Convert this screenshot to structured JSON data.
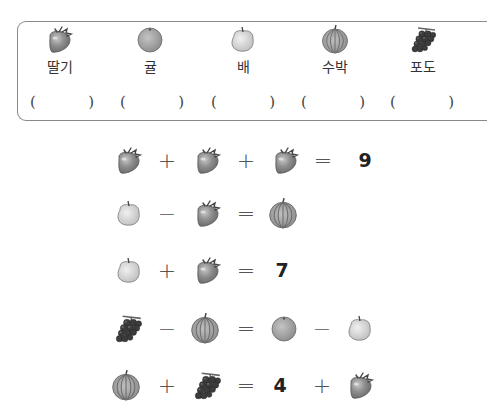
{
  "legend": {
    "items": [
      {
        "key": "strawberry",
        "label": "딸기",
        "answer": ""
      },
      {
        "key": "tangerine",
        "label": "귤",
        "answer": ""
      },
      {
        "key": "pear",
        "label": "배",
        "answer": ""
      },
      {
        "key": "watermelon",
        "label": "수박",
        "answer": ""
      },
      {
        "key": "grapes",
        "label": "포도",
        "answer": ""
      }
    ],
    "paren_open": "(",
    "paren_close": ")"
  },
  "equations": [
    {
      "tokens": [
        {
          "type": "fruit",
          "value": "strawberry"
        },
        {
          "type": "op",
          "value": "+"
        },
        {
          "type": "fruit",
          "value": "strawberry"
        },
        {
          "type": "op",
          "value": "+"
        },
        {
          "type": "fruit",
          "value": "strawberry"
        },
        {
          "type": "op",
          "value": "="
        },
        {
          "type": "num",
          "value": "9"
        }
      ]
    },
    {
      "tokens": [
        {
          "type": "fruit",
          "value": "pear"
        },
        {
          "type": "op",
          "value": "−"
        },
        {
          "type": "fruit",
          "value": "strawberry"
        },
        {
          "type": "op",
          "value": "="
        },
        {
          "type": "fruit",
          "value": "watermelon"
        }
      ]
    },
    {
      "tokens": [
        {
          "type": "fruit",
          "value": "pear"
        },
        {
          "type": "op",
          "value": "+"
        },
        {
          "type": "fruit",
          "value": "strawberry"
        },
        {
          "type": "op",
          "value": "="
        },
        {
          "type": "num",
          "value": "7"
        }
      ]
    },
    {
      "tokens": [
        {
          "type": "fruit",
          "value": "grapes"
        },
        {
          "type": "op",
          "value": "−"
        },
        {
          "type": "fruit",
          "value": "watermelon"
        },
        {
          "type": "op",
          "value": "="
        },
        {
          "type": "fruit",
          "value": "tangerine"
        },
        {
          "type": "op",
          "value": "−"
        },
        {
          "type": "fruit",
          "value": "pear"
        }
      ]
    },
    {
      "tokens": [
        {
          "type": "fruit",
          "value": "watermelon"
        },
        {
          "type": "op",
          "value": "+"
        },
        {
          "type": "fruit",
          "value": "grapes"
        },
        {
          "type": "op",
          "value": "="
        },
        {
          "type": "num",
          "value": "4"
        },
        {
          "type": "op",
          "value": "+"
        },
        {
          "type": "fruit",
          "value": "strawberry"
        }
      ]
    }
  ],
  "colors": {
    "border": "#8a8a8a",
    "text": "#333333",
    "fruit_fill": "#9a9a9a"
  }
}
